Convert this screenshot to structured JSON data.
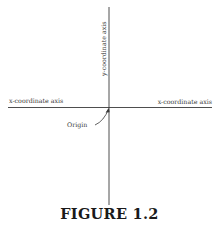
{
  "figure": {
    "caption": "FIGURE 1.2"
  },
  "axes": {
    "x_axis_left_label": "x-coordinate axis",
    "x_axis_right_label": "x-coordinate axis",
    "y_axis_label": "y-coordinate axis",
    "origin_label": "Origin"
  },
  "colors": {
    "line": "#3a3a3a",
    "text": "#2a2a2a",
    "background": "#ffffff"
  }
}
